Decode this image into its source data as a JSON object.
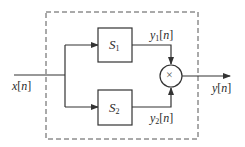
{
  "diagram": {
    "input": {
      "var": "x",
      "index": "n"
    },
    "output": {
      "var": "y",
      "index": "n"
    },
    "blocks": [
      {
        "id": "S1",
        "name": "S",
        "sub": "1"
      },
      {
        "id": "S2",
        "name": "S",
        "sub": "2"
      }
    ],
    "intermediate": [
      {
        "var": "y",
        "sub": "1",
        "index": "n"
      },
      {
        "var": "y",
        "sub": "2",
        "index": "n"
      }
    ],
    "combiner": {
      "symbol": "×",
      "type": "multiplier"
    },
    "colors": {
      "line": "#333333",
      "dashed_box": "#555555"
    }
  }
}
